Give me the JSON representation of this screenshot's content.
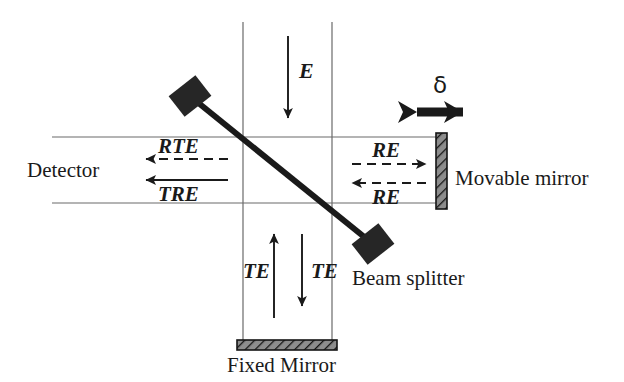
{
  "figure": {
    "background_color": "#ffffff",
    "ink_color": "#1a1a1a",
    "rail_color": "#5a5a5a"
  },
  "labels": {
    "source_beam": "E",
    "detector": "Detector",
    "movable_mirror": "Movable mirror",
    "fixed_mirror": "Fixed Mirror",
    "beam_splitter": "Beam splitter",
    "displacement_symbol": "δ",
    "reflected_to_detector": "RTE",
    "transmitted_to_detector": "TRE",
    "to_movable_mirror": "RE",
    "from_movable_mirror": "RE",
    "to_fixed_mirror_left": "TE",
    "from_fixed_mirror_right": "TE"
  },
  "geometry": {
    "rails": {
      "vertical_left_x": 243,
      "vertical_right_x": 332,
      "vertical_top_y": 22,
      "vertical_bottom_y": 340,
      "horizontal_top_y": 137,
      "horizontal_bottom_y": 203,
      "horizontal_left_x": 52,
      "horizontal_right_x": 440
    },
    "beam_splitter_line": {
      "x1": 196,
      "y1": 101,
      "x2": 368,
      "y2": 240
    },
    "mount_blocks": [
      {
        "cx": 190,
        "cy": 96,
        "w": 34,
        "h": 26,
        "rotation_deg": -38
      },
      {
        "cx": 373,
        "cy": 244,
        "w": 34,
        "h": 26,
        "rotation_deg": -38
      }
    ],
    "movable_mirror_rect": {
      "x": 436,
      "y": 133,
      "w": 11,
      "h": 76
    },
    "fixed_mirror_rect": {
      "x": 237,
      "y": 340,
      "w": 100,
      "h": 10
    },
    "delta_arrow": {
      "x1": 410,
      "y1": 112,
      "x2": 470,
      "y2": 112
    }
  },
  "arrows": [
    {
      "name": "source-beam-arrow",
      "style": "solid",
      "direction": "down",
      "label": "E"
    },
    {
      "name": "rte-arrow",
      "style": "dashed",
      "direction": "left",
      "label": "RTE"
    },
    {
      "name": "tre-arrow",
      "style": "solid",
      "direction": "left",
      "label": "TRE"
    },
    {
      "name": "re-outgoing-arrow",
      "style": "dashed",
      "direction": "right",
      "label": "RE"
    },
    {
      "name": "re-returning-arrow",
      "style": "dashed",
      "direction": "left",
      "label": "RE"
    },
    {
      "name": "te-outgoing-arrow",
      "style": "solid",
      "direction": "down",
      "label": "TE"
    },
    {
      "name": "te-returning-arrow",
      "style": "solid",
      "direction": "up",
      "label": "TE"
    },
    {
      "name": "delta-double-arrow",
      "style": "thick",
      "direction": "both",
      "label": "δ"
    }
  ]
}
